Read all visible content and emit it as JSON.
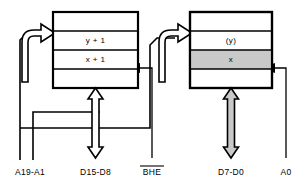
{
  "diagram": {
    "canvas": {
      "width": 300,
      "height": 183,
      "background": "#ffffff"
    },
    "colors": {
      "line": "#000000",
      "background": "#ffffff",
      "shaded_fill": "#c9c9c9",
      "block_fill": "#ffffff"
    }
  },
  "banks": [
    {
      "id": "high-bank",
      "name": "odd-address-bank",
      "rows": [
        {
          "label": "",
          "shaded": false
        },
        {
          "label": "y + 1",
          "shaded": false
        },
        {
          "label": "x + 1",
          "shaded": false
        },
        {
          "label": "",
          "shaded": false
        }
      ]
    },
    {
      "id": "low-bank",
      "name": "even-address-bank",
      "rows": [
        {
          "label": "",
          "shaded": false
        },
        {
          "label": "(y)",
          "shaded": false
        },
        {
          "label": "x",
          "shaded": true
        },
        {
          "label": "",
          "shaded": false
        }
      ]
    }
  ],
  "bus_labels": {
    "address_high": "A19-A1",
    "data_high": "D15-D8",
    "bhe": "BHE",
    "bhe_overlined": true,
    "data_low": "D7-D0",
    "address_low": "A0"
  },
  "bus_lines": [
    {
      "name": "address-bus-a19-a1",
      "label": "A19-A1",
      "style": "thin-line",
      "arrow": "curved-hollow-into-both-banks"
    },
    {
      "name": "data-bus-d15-d8",
      "label": "D15-D8",
      "style": "hollow-double-arrow",
      "filled": false
    },
    {
      "name": "bhe-select-line",
      "label": "BHE",
      "style": "thin-line",
      "arrow": "solid-head-into-high-bank"
    },
    {
      "name": "data-bus-d7-d0",
      "label": "D7-D0",
      "style": "shaded-double-arrow",
      "filled": true
    },
    {
      "name": "address-line-a0",
      "label": "A0",
      "style": "thin-line",
      "arrow": "solid-head-into-low-bank"
    }
  ]
}
